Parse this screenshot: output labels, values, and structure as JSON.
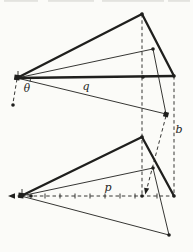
{
  "diagram": {
    "width": 193,
    "height": 252,
    "style": {
      "ink": "#1f1f1d",
      "background": "#fbfbf8",
      "artifact": "#d9d9d4",
      "thick": 2.3,
      "thin": 0.9,
      "dash": "3.5 2.8"
    },
    "labels": [
      {
        "name": "theta-label",
        "text": "θ",
        "x": 27,
        "y": 88,
        "size": 10.5
      },
      {
        "name": "q-label",
        "text": "q",
        "x": 86,
        "y": 86,
        "size": 11
      },
      {
        "name": "b-label",
        "text": "b",
        "x": 179,
        "y": 129,
        "size": 11
      },
      {
        "name": "p-label",
        "text": "p",
        "x": 108,
        "y": 187,
        "size": 11
      }
    ],
    "scan_artifacts": [
      {
        "x": 4,
        "w": 34
      },
      {
        "x": 48,
        "w": 46
      },
      {
        "x": 102,
        "w": 62
      },
      {
        "x": 168,
        "w": 22
      }
    ],
    "dashed_lines": [
      {
        "name": "vertical-from-top-apex",
        "x1": 142,
        "y1": 14,
        "x2": 142,
        "y2": 196
      },
      {
        "name": "vertical-from-right-vertex",
        "x1": 174,
        "y1": 76,
        "x2": 174,
        "y2": 196
      },
      {
        "name": "left-vertex-tail",
        "x1": 17,
        "y1": 79,
        "x2": 13,
        "y2": 103
      },
      {
        "name": "b-transfer-diagonal",
        "x1": 166,
        "y1": 116,
        "x2": 146,
        "y2": 192
      },
      {
        "name": "axis-left-tail",
        "x1": 21,
        "y1": 196,
        "x2": 11,
        "y2": 196
      },
      {
        "name": "p-axis",
        "x1": 21,
        "y1": 196,
        "x2": 174,
        "y2": 196
      }
    ],
    "thin_lines": [
      {
        "name": "top-median",
        "x1": 17,
        "y1": 78,
        "x2": 153,
        "y2": 49
      },
      {
        "name": "top-drop",
        "x1": 153,
        "y1": 49,
        "x2": 166,
        "y2": 114
      },
      {
        "name": "q-line",
        "x1": 17,
        "y1": 78,
        "x2": 166,
        "y2": 114
      },
      {
        "name": "bottom-median",
        "x1": 21,
        "y1": 196,
        "x2": 153,
        "y2": 168
      },
      {
        "name": "bottom-drop",
        "x1": 153,
        "y1": 168,
        "x2": 169,
        "y2": 235
      },
      {
        "name": "p-outer-line",
        "x1": 21,
        "y1": 196,
        "x2": 169,
        "y2": 235
      }
    ],
    "thick_lines": [
      {
        "name": "top-left-side",
        "x1": 17,
        "y1": 78,
        "x2": 142,
        "y2": 14
      },
      {
        "name": "top-right-side",
        "x1": 142,
        "y1": 14,
        "x2": 174,
        "y2": 76
      },
      {
        "name": "top-base",
        "x1": 17,
        "y1": 78,
        "x2": 174,
        "y2": 76
      },
      {
        "name": "bottom-left-side",
        "x1": 21,
        "y1": 196,
        "x2": 142,
        "y2": 137
      },
      {
        "name": "bottom-right-side",
        "x1": 142,
        "y1": 137,
        "x2": 174,
        "y2": 196
      }
    ],
    "ticks": [
      {
        "name": "left-vertex-tick",
        "x1": 18,
        "y1": 71,
        "x2": 18,
        "y2": 77
      },
      {
        "name": "bottom-left-vertex-tick",
        "x1": 22,
        "y1": 189,
        "x2": 22,
        "y2": 195
      },
      {
        "name": "axis-tick",
        "x1": 45,
        "y1": 193.5,
        "x2": 45,
        "y2": 198.5
      },
      {
        "name": "axis-tick",
        "x1": 60,
        "y1": 193.5,
        "x2": 60,
        "y2": 198.5
      },
      {
        "name": "axis-tick",
        "x1": 75,
        "y1": 193.5,
        "x2": 75,
        "y2": 198.5
      },
      {
        "name": "axis-tick",
        "x1": 90,
        "y1": 193.5,
        "x2": 90,
        "y2": 198.5
      },
      {
        "name": "axis-tick",
        "x1": 105,
        "y1": 193.5,
        "x2": 105,
        "y2": 198.5
      },
      {
        "name": "axis-tick",
        "x1": 120,
        "y1": 193.5,
        "x2": 120,
        "y2": 198.5
      },
      {
        "name": "axis-tick",
        "x1": 135,
        "y1": 193.5,
        "x2": 135,
        "y2": 198.5
      },
      {
        "name": "axis-tick",
        "x1": 157,
        "y1": 193.5,
        "x2": 157,
        "y2": 198.5
      }
    ],
    "theta_arc": {
      "name": "theta-angle-arc",
      "cx": 17,
      "cy": 78,
      "r": 13.5,
      "a1": -1,
      "a2": 15
    },
    "dots": [
      {
        "name": "top-apex-dot",
        "x": 142,
        "y": 14
      },
      {
        "name": "top-right-dot",
        "x": 174,
        "y": 76
      },
      {
        "name": "top-mid-dot",
        "x": 153,
        "y": 49
      },
      {
        "name": "top-base-dot",
        "x": 143,
        "y": 77
      },
      {
        "name": "tail-end-dot",
        "x": 13,
        "y": 105
      },
      {
        "name": "bottom-apex-dot",
        "x": 142,
        "y": 137
      },
      {
        "name": "bottom-right-dot",
        "x": 174,
        "y": 196
      },
      {
        "name": "bottom-mid-dot",
        "x": 153,
        "y": 168
      },
      {
        "name": "bottom-outer-dot",
        "x": 169,
        "y": 235
      },
      {
        "name": "axis-unit-dot",
        "x": 31,
        "y": 196
      },
      {
        "name": "axis-apex-foot-dot",
        "x": 142,
        "y": 196
      }
    ],
    "square_dots": [
      {
        "name": "top-left-vertex-marker",
        "x": 17,
        "y": 77.5,
        "s": 5.5,
        "rot": 8
      },
      {
        "name": "q-end-marker",
        "x": 166,
        "y": 114.5,
        "s": 5,
        "rot": 15
      },
      {
        "name": "bottom-left-vertex-marker",
        "x": 21,
        "y": 195.5,
        "s": 5.5,
        "rot": 8
      }
    ],
    "arrowheads": [
      {
        "name": "axis-left-arrowhead",
        "points": "8,196 15,193.2 15,198.8"
      },
      {
        "name": "b-transfer-arrowhead",
        "points": "145.3,194.5 149.2,188.6 144.1,187.8"
      }
    ]
  }
}
